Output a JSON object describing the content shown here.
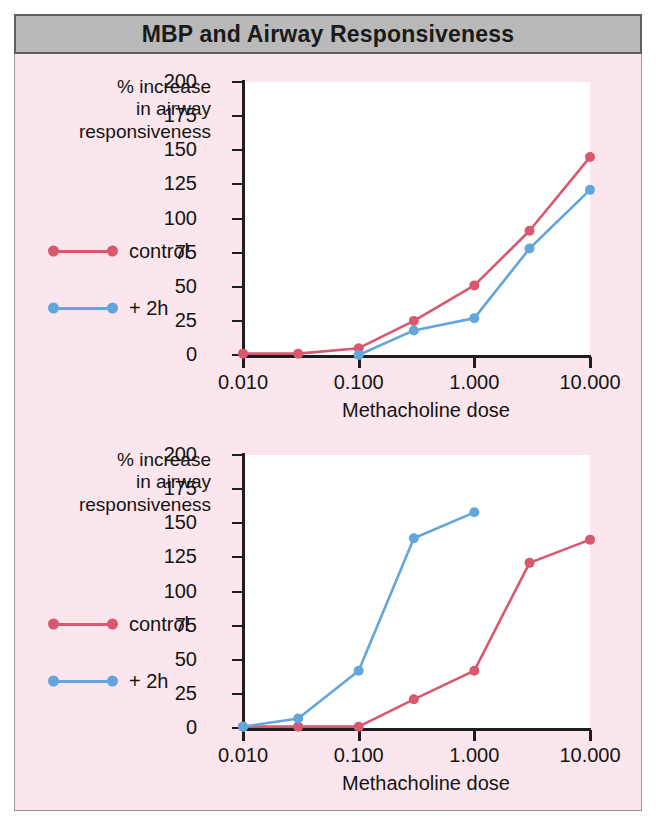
{
  "header": {
    "title": "MBP and Airway Responsiveness",
    "background_color": "#b9b9b9",
    "border_color": "#5e5e5e",
    "text_color": "#1a1a1a"
  },
  "figure": {
    "background_color": "#fae6ec",
    "plot_background_color": "#ffffff",
    "axis_color": "#1d1d1d",
    "control_color": "#d9586f",
    "plus2h_color": "#63a6dc"
  },
  "axes": {
    "y_caption_lines": [
      "% increase",
      "in airway",
      "responsiveness"
    ],
    "y_ticks": [
      0,
      25,
      50,
      75,
      100,
      125,
      150,
      175,
      200
    ],
    "x_tick_labels": [
      "0.010",
      "0.100",
      "1.000",
      "10.000"
    ],
    "x_tick_values": [
      0.01,
      0.1,
      1.0,
      10.0
    ],
    "x_axis_title": "Methacholine dose",
    "ylim": [
      0,
      200
    ],
    "xlim": [
      0.01,
      10.0
    ],
    "x_scale": "log"
  },
  "legend": {
    "items": [
      {
        "label": "control",
        "color": "#d9586f"
      },
      {
        "label": "+ 2h",
        "color": "#63a6dc"
      }
    ]
  },
  "chart_data": [
    {
      "id": "panel-top",
      "type": "line",
      "title": "",
      "xlabel": "Methacholine dose",
      "ylabel": "% increase in airway responsiveness",
      "x_scale": "log",
      "xlim": [
        0.01,
        10.0
      ],
      "ylim": [
        0,
        200
      ],
      "grid": false,
      "legend_position": "left-outside",
      "series": [
        {
          "name": "control",
          "color": "#d9586f",
          "x": [
            0.01,
            0.03,
            0.1,
            0.3,
            1.0,
            3.0,
            10.0
          ],
          "values": [
            1,
            1,
            5,
            25,
            51,
            91,
            145
          ]
        },
        {
          "name": "+ 2h",
          "color": "#63a6dc",
          "x": [
            0.1,
            0.3,
            1.0,
            3.0,
            10.0
          ],
          "values": [
            0,
            18,
            27,
            78,
            121
          ]
        }
      ]
    },
    {
      "id": "panel-bottom",
      "type": "line",
      "title": "",
      "xlabel": "Methacholine dose",
      "ylabel": "% increase in airway responsiveness",
      "x_scale": "log",
      "xlim": [
        0.01,
        10.0
      ],
      "ylim": [
        0,
        200
      ],
      "grid": false,
      "legend_position": "left-outside",
      "series": [
        {
          "name": "control",
          "color": "#d9586f",
          "x": [
            0.01,
            0.03,
            0.1,
            0.3,
            1.0,
            3.0,
            10.0
          ],
          "values": [
            1,
            1,
            1,
            21,
            42,
            121,
            138
          ]
        },
        {
          "name": "+ 2h",
          "color": "#63a6dc",
          "x": [
            0.01,
            0.03,
            0.1,
            0.3,
            1.0
          ],
          "values": [
            1,
            7,
            42,
            139,
            158
          ]
        }
      ]
    }
  ]
}
